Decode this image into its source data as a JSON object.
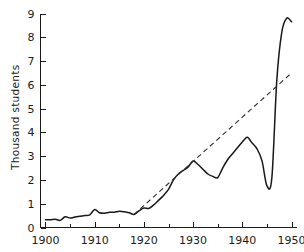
{
  "chart_data": {
    "type": "line",
    "title": "",
    "xlabel": "",
    "ylabel": "Thousand students",
    "xlim": [
      1899,
      1951
    ],
    "ylim": [
      0,
      9
    ],
    "grid": false,
    "legend": null,
    "x_ticks": [
      1900,
      1910,
      1920,
      1930,
      1940,
      1950
    ],
    "x_tick_labels": [
      "1900",
      "1910",
      "1920",
      "1930",
      "1940",
      "1950"
    ],
    "x_minor_ticks": [
      1905,
      1915,
      1925,
      1935,
      1945
    ],
    "y_ticks": [
      0,
      1,
      2,
      3,
      4,
      5,
      6,
      7,
      8,
      9
    ],
    "y_tick_labels": [
      "0",
      "1",
      "2",
      "3",
      "4",
      "5",
      "6",
      "7",
      "8",
      "9"
    ],
    "series": [
      {
        "name": "enrollment",
        "style": "solid",
        "x": [
          1900,
          1901,
          1902,
          1903,
          1904,
          1905,
          1906,
          1907,
          1908,
          1909,
          1910,
          1911,
          1912,
          1913,
          1914,
          1915,
          1916,
          1917,
          1918,
          1919,
          1920,
          1921,
          1922,
          1923,
          1924,
          1925,
          1926,
          1927,
          1928,
          1929,
          1930,
          1931,
          1932,
          1933,
          1934,
          1935,
          1936,
          1937,
          1938,
          1939,
          1940,
          1941,
          1942,
          1943,
          1944,
          1945,
          1946,
          1947,
          1948,
          1949,
          1950
        ],
        "y": [
          0.33,
          0.33,
          0.35,
          0.3,
          0.45,
          0.4,
          0.44,
          0.47,
          0.5,
          0.53,
          0.76,
          0.62,
          0.6,
          0.64,
          0.64,
          0.68,
          0.66,
          0.62,
          0.55,
          0.7,
          0.82,
          0.8,
          0.95,
          1.15,
          1.35,
          1.6,
          2.0,
          2.25,
          2.4,
          2.55,
          2.8,
          2.65,
          2.45,
          2.25,
          2.15,
          2.1,
          2.5,
          2.85,
          3.1,
          3.35,
          3.6,
          3.8,
          3.55,
          3.3,
          2.8,
          1.75,
          2.1,
          6.2,
          8.2,
          8.8,
          8.65
        ]
      },
      {
        "name": "trend",
        "style": "dashed",
        "x": [
          1918,
          1950
        ],
        "y": [
          0.55,
          6.5
        ]
      }
    ]
  }
}
